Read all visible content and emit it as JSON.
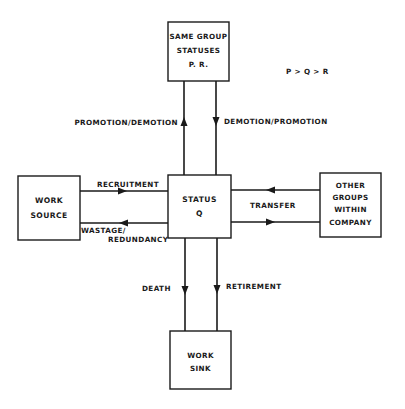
{
  "diagram": {
    "legend": "P > Q > R",
    "boxes": {
      "same_group": [
        "SAME GROUP",
        "STATUSES",
        "P. R."
      ],
      "status_q": [
        "STATUS",
        "Q"
      ],
      "work_source": [
        "WORK",
        "SOURCE"
      ],
      "other_groups": [
        "OTHER",
        "GROUPS",
        "WITHIN",
        "COMPANY"
      ],
      "work_sink": [
        "WORK",
        "SINK"
      ]
    },
    "flows": {
      "promotion_demotion": "PROMOTION/DEMOTION",
      "demotion_promotion": "DEMOTION/PROMOTION",
      "recruitment": "RECRUITMENT",
      "wastage": "WASTAGE/",
      "redundancy": "REDUNDANCY",
      "transfer": "TRANSFER",
      "death": "DEATH",
      "retirement": "RETIREMENT"
    }
  }
}
